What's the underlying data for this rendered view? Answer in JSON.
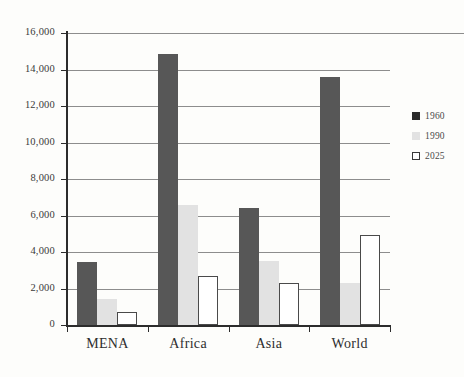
{
  "chart_data": {
    "type": "bar",
    "title": "",
    "subtitle": "",
    "xlabel": "",
    "ylabel": "",
    "categories": [
      "MENA",
      "Africa",
      "Asia",
      "World"
    ],
    "series": [
      {
        "name": "1960",
        "color": "#575757",
        "values": [
          3450,
          14850,
          6400,
          13600
        ]
      },
      {
        "name": "1990",
        "color": "#e2e2e2",
        "values": [
          1450,
          6600,
          3500,
          2300
        ]
      },
      {
        "name": "2025",
        "color": "#ffffff",
        "values": [
          700,
          2700,
          2300,
          4950
        ]
      }
    ],
    "ylim": [
      0,
      16000
    ],
    "ytick_step": 2000,
    "ytick_labels": [
      "0",
      "2,000",
      "4,000",
      "6,000",
      "8,000",
      "10,000",
      "12,000",
      "14,000",
      "16,000"
    ],
    "ytick_values": [
      0,
      2000,
      4000,
      6000,
      8000,
      10000,
      12000,
      14000,
      16000
    ],
    "grid": true,
    "legend_position": "right",
    "legend_entries": [
      "1960",
      "1990",
      "2025"
    ]
  }
}
